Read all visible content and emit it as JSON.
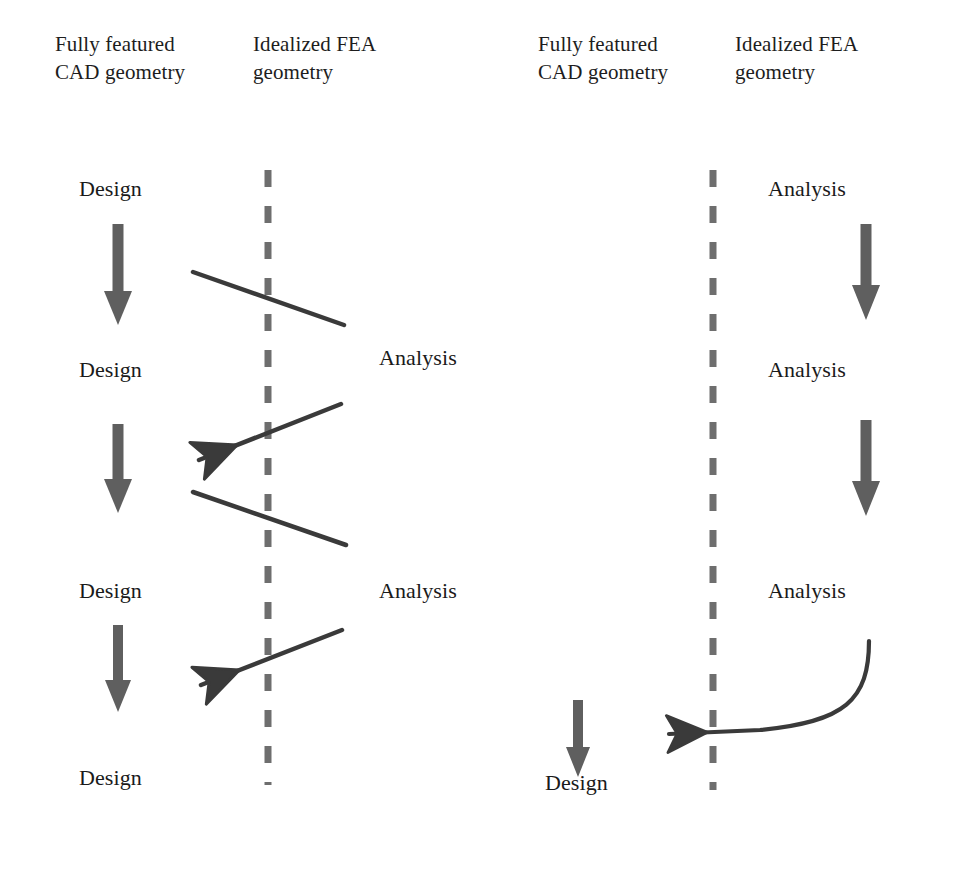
{
  "diagram": {
    "title_visible": false,
    "type": "process-flow-comparison",
    "colors": {
      "text": "#1a1a1a",
      "arrow_gray": "#5f5f5f",
      "line_dark": "#3a3a3a",
      "divider_gray": "#6e6e6e",
      "background": "#ffffff"
    },
    "panels": [
      {
        "id": "left-panel",
        "name": "traditional-iterative-workflow",
        "headers": [
          {
            "id": "left-cad-header",
            "text": "Fully featured\nCAD geometry"
          },
          {
            "id": "left-fea-header",
            "text": "Idealized FEA\ngeometry"
          }
        ],
        "design_nodes": [
          {
            "label": "Design"
          },
          {
            "label": "Design"
          },
          {
            "label": "Design"
          },
          {
            "label": "Design"
          }
        ],
        "analysis_nodes": [
          {
            "label": "Analysis"
          },
          {
            "label": "Analysis"
          }
        ],
        "down_arrow_count": 3,
        "transfer_arrow_count": 2,
        "return_arrow_count": 2,
        "divider": "dashed-vertical"
      },
      {
        "id": "right-panel",
        "name": "integrated-analysis-workflow",
        "headers": [
          {
            "id": "right-cad-header",
            "text": "Fully featured\nCAD geometry"
          },
          {
            "id": "right-fea-header",
            "text": "Idealized FEA\ngeometry"
          }
        ],
        "design_nodes": [
          {
            "label": "Design"
          }
        ],
        "analysis_nodes": [
          {
            "label": "Analysis"
          },
          {
            "label": "Analysis"
          },
          {
            "label": "Analysis"
          }
        ],
        "down_arrow_count": 3,
        "curved_return_arrow_count": 1,
        "divider": "dashed-vertical"
      }
    ]
  }
}
